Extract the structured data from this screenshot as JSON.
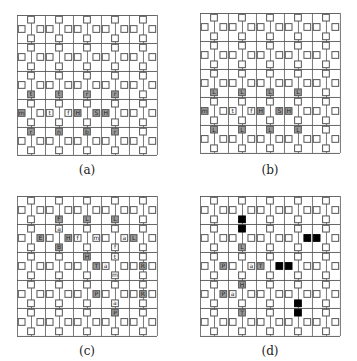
{
  "figure": {
    "cell_size": 9.33,
    "rows": 15,
    "cols": 15,
    "line_every_rows": 3,
    "colors": {
      "line": "#555555",
      "square_border": "#555555",
      "square_fill": "#ffffff",
      "labeled_fill": "#9a9a9a",
      "black_fill": "#000000",
      "letter": "#222222"
    },
    "square_pattern": {
      "row_mod_0_cols_mod3": [
        1
      ],
      "row_mod_1_cols_mod3": [
        0,
        2
      ],
      "row_mod_2_cols_mod3": [
        1
      ]
    }
  },
  "panels": [
    {
      "id": "a",
      "caption": "(a)",
      "origin": [
        17,
        15
      ],
      "labels": [
        {
          "r": 8,
          "c": 1,
          "t": "t",
          "gray": true
        },
        {
          "r": 8,
          "c": 4,
          "t": "t",
          "gray": true
        },
        {
          "r": 8,
          "c": 7,
          "t": "r",
          "gray": true
        },
        {
          "r": 8,
          "c": 10,
          "t": "r",
          "gray": true
        },
        {
          "r": 10,
          "c": 0,
          "t": "m",
          "gray": true
        },
        {
          "r": 10,
          "c": 3,
          "t": "t",
          "gray": false
        },
        {
          "r": 10,
          "c": 5,
          "t": "f",
          "gray": false
        },
        {
          "r": 10,
          "c": 6,
          "t": "H",
          "gray": true
        },
        {
          "r": 10,
          "c": 8,
          "t": "S",
          "gray": true
        },
        {
          "r": 10,
          "c": 9,
          "t": "H",
          "gray": true
        },
        {
          "r": 12,
          "c": 1,
          "t": "r",
          "gray": true
        },
        {
          "r": 12,
          "c": 4,
          "t": "n",
          "gray": true
        },
        {
          "r": 12,
          "c": 7,
          "t": "b",
          "gray": true
        },
        {
          "r": 12,
          "c": 10,
          "t": "r",
          "gray": true
        }
      ],
      "black": []
    },
    {
      "id": "b",
      "caption": "(b)",
      "origin": [
        200,
        13
      ],
      "labels": [
        {
          "r": 8,
          "c": 1,
          "t": "L",
          "gray": true
        },
        {
          "r": 8,
          "c": 4,
          "t": "L",
          "gray": true
        },
        {
          "r": 8,
          "c": 7,
          "t": "L",
          "gray": true
        },
        {
          "r": 8,
          "c": 10,
          "t": "L",
          "gray": true
        },
        {
          "r": 10,
          "c": 0,
          "t": "m",
          "gray": true
        },
        {
          "r": 10,
          "c": 3,
          "t": "t",
          "gray": false
        },
        {
          "r": 10,
          "c": 5,
          "t": "f",
          "gray": false
        },
        {
          "r": 10,
          "c": 6,
          "t": "H",
          "gray": true
        },
        {
          "r": 10,
          "c": 8,
          "t": "S",
          "gray": true
        },
        {
          "r": 10,
          "c": 9,
          "t": "H",
          "gray": true
        },
        {
          "r": 12,
          "c": 1,
          "t": "L",
          "gray": true
        },
        {
          "r": 12,
          "c": 4,
          "t": "L",
          "gray": true
        },
        {
          "r": 12,
          "c": 7,
          "t": "L",
          "gray": true
        },
        {
          "r": 12,
          "c": 10,
          "t": "L",
          "gray": true
        }
      ],
      "black": []
    },
    {
      "id": "c",
      "caption": "(c)",
      "origin": [
        17,
        196
      ],
      "labels": [
        {
          "r": 2,
          "c": 4,
          "t": "F",
          "gray": true
        },
        {
          "r": 2,
          "c": 7,
          "t": "L",
          "gray": true
        },
        {
          "r": 2,
          "c": 10,
          "t": "L",
          "gray": true
        },
        {
          "r": 3,
          "c": 4,
          "t": "a",
          "gray": false
        },
        {
          "r": 4,
          "c": 2,
          "t": "E",
          "gray": true
        },
        {
          "r": 4,
          "c": 5,
          "t": "H",
          "gray": true
        },
        {
          "r": 4,
          "c": 6,
          "t": "f",
          "gray": false
        },
        {
          "r": 4,
          "c": 8,
          "t": "m",
          "gray": false
        },
        {
          "r": 4,
          "c": 11,
          "t": "a",
          "gray": false
        },
        {
          "r": 4,
          "c": 12,
          "t": "L",
          "gray": true
        },
        {
          "r": 5,
          "c": 4,
          "t": "B",
          "gray": true
        },
        {
          "r": 5,
          "c": 10,
          "t": "f",
          "gray": false
        },
        {
          "r": 6,
          "c": 7,
          "t": "H",
          "gray": true
        },
        {
          "r": 6,
          "c": 10,
          "t": "t",
          "gray": false
        },
        {
          "r": 7,
          "c": 8,
          "t": "T",
          "gray": true
        },
        {
          "r": 7,
          "c": 9,
          "t": "a",
          "gray": false
        },
        {
          "r": 7,
          "c": 13,
          "t": "R",
          "gray": true
        },
        {
          "r": 8,
          "c": 10,
          "t": "m",
          "gray": false
        },
        {
          "r": 10,
          "c": 8,
          "t": "P",
          "gray": true
        },
        {
          "r": 10,
          "c": 13,
          "t": "R",
          "gray": true
        },
        {
          "r": 11,
          "c": 10,
          "t": "a",
          "gray": false
        },
        {
          "r": 12,
          "c": 10,
          "t": "P",
          "gray": true
        }
      ],
      "black": []
    },
    {
      "id": "d",
      "caption": "(d)",
      "origin": [
        200,
        196
      ],
      "labels": [
        {
          "r": 5,
          "c": 4,
          "t": "L",
          "gray": true
        },
        {
          "r": 7,
          "c": 2,
          "t": "P",
          "gray": true
        },
        {
          "r": 7,
          "c": 5,
          "t": "a",
          "gray": false
        },
        {
          "r": 7,
          "c": 6,
          "t": "T",
          "gray": true
        },
        {
          "r": 9,
          "c": 4,
          "t": "H",
          "gray": true
        },
        {
          "r": 10,
          "c": 2,
          "t": "P",
          "gray": true
        },
        {
          "r": 10,
          "c": 3,
          "t": "a",
          "gray": false
        },
        {
          "r": 12,
          "c": 4,
          "t": "T",
          "gray": true
        }
      ],
      "black": [
        {
          "r": 2,
          "c": 4
        },
        {
          "r": 3,
          "c": 4
        },
        {
          "r": 4,
          "c": 11
        },
        {
          "r": 4,
          "c": 12
        },
        {
          "r": 7,
          "c": 8
        },
        {
          "r": 7,
          "c": 9
        },
        {
          "r": 11,
          "c": 10
        },
        {
          "r": 12,
          "c": 10
        }
      ]
    }
  ],
  "captions": {
    "a": "(a)",
    "b": "(b)",
    "c": "(c)",
    "d": "(d)"
  }
}
